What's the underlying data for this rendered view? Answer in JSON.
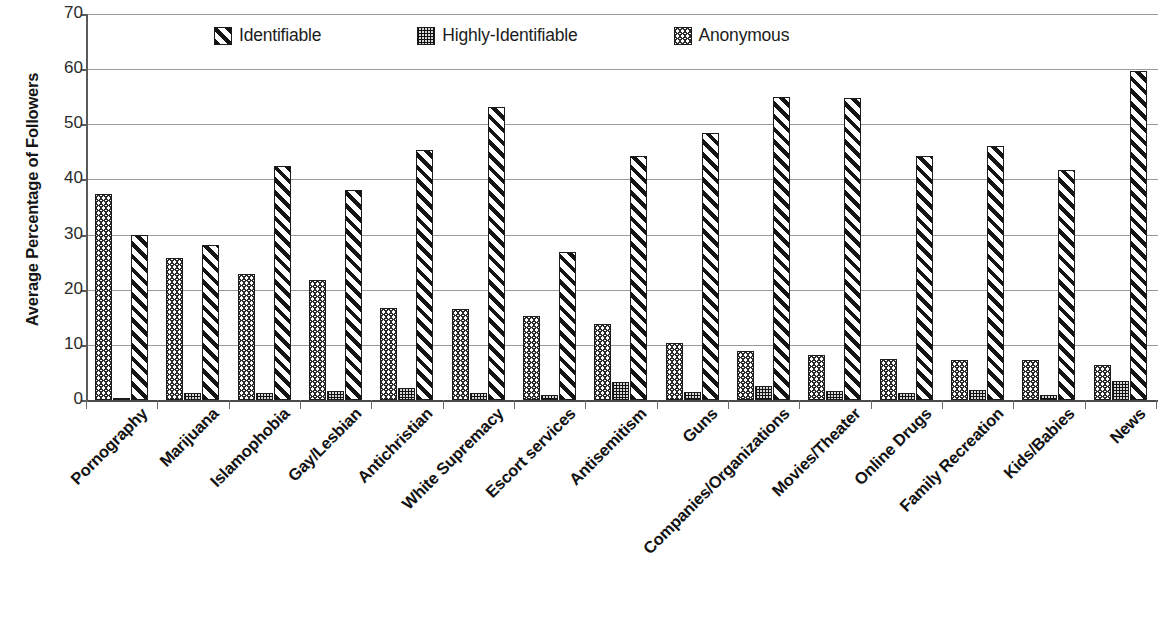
{
  "chart_data": {
    "type": "bar",
    "title": "",
    "xlabel": "",
    "ylabel": "Average Percentage of Followers",
    "ylim": [
      0,
      70
    ],
    "ytick_step": 10,
    "yticks": [
      70,
      60,
      50,
      40,
      30,
      20,
      10,
      0
    ],
    "grid": "horizontal",
    "legend_position": "top-inside",
    "legend_order": [
      "Identifiable",
      "Highly-Identifiable",
      "Anonymous"
    ],
    "bar_order_in_group": [
      "Anonymous",
      "Highly-Identifiable",
      "Identifiable"
    ],
    "categories": [
      "Pornography",
      "Marijuana",
      "Islamophobia",
      "Gay/Lesbian",
      "Antichristian",
      "White Supremacy",
      "Escort services",
      "Antisemitism",
      "Guns",
      "Companies/Organizations",
      "Movies/Theater",
      "Online Drugs",
      "Family Recreation",
      "Kids/Babies",
      "News"
    ],
    "series": [
      {
        "name": "Anonymous",
        "pattern": "zigzag",
        "values": [
          37.4,
          25.8,
          22.8,
          21.7,
          16.7,
          16.5,
          15.3,
          13.8,
          10.3,
          8.9,
          8.1,
          7.5,
          7.2,
          7.2,
          6.4
        ]
      },
      {
        "name": "Highly-Identifiable",
        "pattern": "dotted",
        "values": [
          0.4,
          1.2,
          1.3,
          1.7,
          2.1,
          1.3,
          1.0,
          3.3,
          1.5,
          2.6,
          1.6,
          1.3,
          1.9,
          1.0,
          3.5
        ]
      },
      {
        "name": "Identifiable",
        "pattern": "diagonal",
        "values": [
          30.0,
          28.1,
          42.4,
          38.1,
          45.4,
          53.2,
          26.9,
          44.3,
          48.5,
          55.0,
          54.8,
          44.2,
          46.1,
          41.7,
          59.6
        ]
      }
    ]
  },
  "legend": {
    "items": [
      {
        "label": "Identifiable",
        "swatch": "diagonal-stripe-swatch"
      },
      {
        "label": "Highly-Identifiable",
        "swatch": "dotted-swatch"
      },
      {
        "label": "Anonymous",
        "swatch": "zigzag-swatch"
      }
    ]
  },
  "colors": {
    "ink": "#1c1c1c",
    "gridline": "#9a9a9a",
    "axis": "#5a5a5a",
    "background": "#ffffff"
  }
}
